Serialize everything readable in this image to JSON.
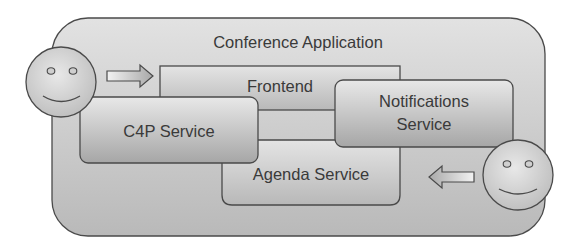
{
  "diagram": {
    "title": "Conference Application",
    "boxes": {
      "frontend": "Frontend",
      "c4p": "C4P Service",
      "notifications_line1": "Notifications",
      "notifications_line2": "Service",
      "agenda": "Agenda Service"
    },
    "actors": [
      {
        "name": "user-left",
        "icon": "smiley-face"
      },
      {
        "name": "user-right",
        "icon": "smiley-face"
      }
    ],
    "arrows": [
      {
        "direction": "right",
        "target": "Frontend"
      },
      {
        "direction": "left",
        "target": "Agenda Service"
      }
    ],
    "colors": {
      "stroke": "#4a4a4a",
      "fill_light": "#e6e6e6",
      "fill_dark": "#a8a8a8",
      "text": "#3a3a3a"
    }
  }
}
